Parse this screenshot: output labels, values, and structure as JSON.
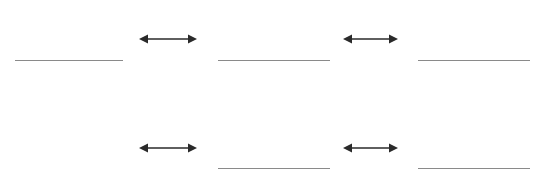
{
  "canvas": {
    "width": 538,
    "height": 180,
    "background": "#ffffff"
  },
  "style": {
    "level_line_color": "#8a8a8a",
    "level_line_width": 1.2,
    "arrow_color": "#2a2a2a",
    "arrow_shaft_width": 1.3,
    "arrow_head_length": 9,
    "arrow_head_half_height": 4.5
  },
  "diagram": {
    "levels": [
      {
        "id": "level-1",
        "row": "top",
        "x1": 15,
        "x2": 123,
        "y": 60.5
      },
      {
        "id": "level-2",
        "row": "top",
        "x1": 218,
        "x2": 330,
        "y": 60.5
      },
      {
        "id": "level-3",
        "row": "top",
        "x1": 418,
        "x2": 530,
        "y": 60.5
      },
      {
        "id": "level-4",
        "row": "bottom",
        "x1": 218,
        "x2": 330,
        "y": 168.5
      },
      {
        "id": "level-5",
        "row": "bottom",
        "x1": 418,
        "x2": 530,
        "y": 168.5
      }
    ],
    "arrows": [
      {
        "id": "arrow-1",
        "row": "top",
        "x1": 139,
        "x2": 197,
        "y": 39
      },
      {
        "id": "arrow-2",
        "row": "top",
        "x1": 343,
        "x2": 398,
        "y": 39
      },
      {
        "id": "arrow-3",
        "row": "bottom",
        "x1": 139,
        "x2": 197,
        "y": 148
      },
      {
        "id": "arrow-4",
        "row": "bottom",
        "x1": 343,
        "x2": 398,
        "y": 148
      }
    ]
  }
}
